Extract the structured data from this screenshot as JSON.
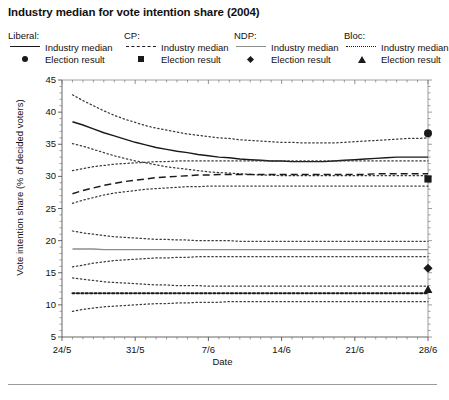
{
  "title": "Industry median for vote intention share (2004)",
  "legend": {
    "groups": [
      {
        "party": "Liberal:",
        "median_label": "Industry median",
        "result_label": "Election result",
        "style": "solid",
        "marker": "circle"
      },
      {
        "party": "CP:",
        "median_label": "Industry median",
        "result_label": "Election result",
        "style": "dashed",
        "marker": "square"
      },
      {
        "party": "NDP:",
        "median_label": "Industry median",
        "result_label": "Election result",
        "style": "solid-grey",
        "marker": "diamond"
      },
      {
        "party": "Bloc:",
        "median_label": "Industry median",
        "result_label": "Election result",
        "style": "dotted",
        "marker": "triangle"
      }
    ]
  },
  "chart_data": {
    "type": "line",
    "title": "Industry median for vote intention share (2004)",
    "xlabel": "Date",
    "ylabel": "Vote intention share (% of decided voters)",
    "xlim": [
      0,
      35
    ],
    "ylim": [
      5,
      45
    ],
    "yticks": [
      5,
      10,
      15,
      20,
      25,
      30,
      35,
      40,
      45
    ],
    "xtick_positions": [
      0,
      7,
      14,
      21,
      28
    ],
    "xticklabels": [
      "24/5",
      "31/5",
      "7/6",
      "14/6",
      "21/6",
      "28/6"
    ],
    "grid": false,
    "legend_position": "above-plot",
    "x": [
      1,
      2,
      3,
      4,
      5,
      6,
      7,
      8,
      9,
      10,
      11,
      12,
      13,
      14,
      15,
      16,
      17,
      18,
      19,
      20,
      21,
      22,
      23,
      24,
      25,
      26,
      27,
      28,
      29,
      30,
      31,
      32,
      33,
      34,
      35
    ],
    "series": [
      {
        "name": "Liberal industry median",
        "party": "Liberal",
        "style": "solid",
        "color": "#1a1a1a",
        "values": [
          38.5,
          38.0,
          37.4,
          36.8,
          36.3,
          35.8,
          35.3,
          34.9,
          34.5,
          34.2,
          33.9,
          33.7,
          33.4,
          33.2,
          33.0,
          32.9,
          32.7,
          32.6,
          32.5,
          32.4,
          32.4,
          32.3,
          32.3,
          32.3,
          32.3,
          32.4,
          32.5,
          32.6,
          32.7,
          32.8,
          32.9,
          33.0,
          33.0,
          33.0,
          33.0
        ]
      },
      {
        "name": "Liberal upper band",
        "party": "Liberal",
        "style": "dotted",
        "color": "#3a3a3a",
        "values": [
          42.7,
          41.8,
          41.0,
          40.2,
          39.5,
          38.9,
          38.4,
          37.9,
          37.5,
          37.2,
          36.9,
          36.6,
          36.4,
          36.2,
          36.0,
          35.9,
          35.7,
          35.6,
          35.5,
          35.4,
          35.3,
          35.3,
          35.2,
          35.2,
          35.2,
          35.2,
          35.3,
          35.4,
          35.5,
          35.6,
          35.7,
          35.8,
          35.9,
          35.9,
          36.0
        ]
      },
      {
        "name": "Liberal lower band",
        "party": "Liberal",
        "style": "dotted",
        "color": "#3a3a3a",
        "values": [
          35.1,
          34.7,
          34.2,
          33.7,
          33.2,
          32.8,
          32.4,
          32.1,
          31.8,
          31.5,
          31.3,
          31.1,
          30.9,
          30.7,
          30.6,
          30.5,
          30.4,
          30.3,
          30.2,
          30.2,
          30.1,
          30.1,
          30.1,
          30.1,
          30.1,
          30.1,
          30.1,
          30.1,
          30.1,
          30.1,
          30.1,
          30.1,
          30.1,
          30.1,
          30.1
        ]
      },
      {
        "name": "CP industry median",
        "party": "CP",
        "style": "dashed",
        "color": "#1a1a1a",
        "values": [
          27.3,
          27.8,
          28.2,
          28.6,
          28.9,
          29.2,
          29.4,
          29.6,
          29.8,
          29.9,
          30.0,
          30.1,
          30.2,
          30.2,
          30.3,
          30.3,
          30.3,
          30.3,
          30.3,
          30.3,
          30.3,
          30.3,
          30.3,
          30.3,
          30.3,
          30.3,
          30.3,
          30.3,
          30.3,
          30.4,
          30.4,
          30.4,
          30.4,
          30.4,
          30.4
        ]
      },
      {
        "name": "CP upper band",
        "party": "CP",
        "style": "dotted",
        "color": "#3a3a3a",
        "values": [
          30.9,
          31.2,
          31.5,
          31.7,
          31.9,
          32.0,
          32.1,
          32.2,
          32.3,
          32.3,
          32.4,
          32.4,
          32.4,
          32.4,
          32.4,
          32.4,
          32.4,
          32.4,
          32.4,
          32.4,
          32.4,
          32.4,
          32.4,
          32.4,
          32.4,
          32.4,
          32.4,
          32.4,
          32.4,
          32.4,
          32.4,
          32.4,
          32.4,
          32.4,
          32.4
        ]
      },
      {
        "name": "CP lower band",
        "party": "CP",
        "style": "dotted",
        "color": "#3a3a3a",
        "values": [
          25.8,
          26.3,
          26.7,
          27.1,
          27.4,
          27.6,
          27.8,
          28.0,
          28.1,
          28.2,
          28.3,
          28.4,
          28.4,
          28.5,
          28.5,
          28.5,
          28.5,
          28.5,
          28.5,
          28.5,
          28.5,
          28.5,
          28.5,
          28.5,
          28.5,
          28.5,
          28.5,
          28.5,
          28.5,
          28.5,
          28.5,
          28.5,
          28.5,
          28.5,
          28.5
        ]
      },
      {
        "name": "NDP industry median",
        "party": "NDP",
        "style": "solid-grey",
        "color": "#8d8d8d",
        "values": [
          18.7,
          18.7,
          18.7,
          18.6,
          18.6,
          18.6,
          18.6,
          18.6,
          18.6,
          18.6,
          18.6,
          18.6,
          18.6,
          18.6,
          18.6,
          18.6,
          18.6,
          18.6,
          18.6,
          18.6,
          18.6,
          18.6,
          18.6,
          18.6,
          18.6,
          18.6,
          18.6,
          18.6,
          18.6,
          18.6,
          18.6,
          18.6,
          18.6,
          18.6,
          18.6
        ]
      },
      {
        "name": "NDP upper band",
        "party": "NDP",
        "style": "dotted",
        "color": "#3a3a3a",
        "values": [
          21.5,
          21.2,
          21.0,
          20.8,
          20.6,
          20.5,
          20.4,
          20.3,
          20.2,
          20.2,
          20.1,
          20.1,
          20.0,
          20.0,
          20.0,
          20.0,
          19.9,
          19.9,
          19.9,
          19.9,
          19.9,
          19.9,
          19.9,
          19.9,
          19.9,
          19.9,
          19.9,
          19.9,
          19.9,
          19.9,
          19.9,
          19.9,
          19.9,
          19.9,
          19.9
        ]
      },
      {
        "name": "NDP lower band",
        "party": "NDP",
        "style": "dotted",
        "color": "#3a3a3a",
        "values": [
          15.9,
          16.2,
          16.5,
          16.7,
          16.9,
          17.0,
          17.1,
          17.2,
          17.3,
          17.3,
          17.4,
          17.4,
          17.5,
          17.5,
          17.5,
          17.5,
          17.5,
          17.5,
          17.5,
          17.5,
          17.5,
          17.5,
          17.5,
          17.5,
          17.5,
          17.5,
          17.5,
          17.5,
          17.5,
          17.5,
          17.5,
          17.5,
          17.5,
          17.5,
          17.5
        ]
      },
      {
        "name": "Bloc industry median",
        "party": "Bloc",
        "style": "dotted-thick",
        "color": "#1a1a1a",
        "values": [
          11.8,
          11.8,
          11.8,
          11.8,
          11.8,
          11.8,
          11.8,
          11.8,
          11.8,
          11.8,
          11.8,
          11.8,
          11.8,
          11.8,
          11.8,
          11.8,
          11.8,
          11.8,
          11.8,
          11.8,
          11.8,
          11.8,
          11.8,
          11.8,
          11.8,
          11.8,
          11.8,
          11.8,
          11.8,
          11.8,
          11.8,
          11.8,
          11.8,
          11.8,
          11.8
        ]
      },
      {
        "name": "Bloc upper band",
        "party": "Bloc",
        "style": "dotted",
        "color": "#3a3a3a",
        "values": [
          14.2,
          14.0,
          13.8,
          13.6,
          13.5,
          13.4,
          13.3,
          13.2,
          13.1,
          13.1,
          13.0,
          13.0,
          13.0,
          12.9,
          12.9,
          12.9,
          12.9,
          12.9,
          12.9,
          12.9,
          12.9,
          12.9,
          12.9,
          12.9,
          12.9,
          12.9,
          12.9,
          12.9,
          12.9,
          12.9,
          12.9,
          12.9,
          12.9,
          12.9,
          12.9
        ]
      },
      {
        "name": "Bloc lower band",
        "party": "Bloc",
        "style": "dotted",
        "color": "#3a3a3a",
        "values": [
          9.0,
          9.3,
          9.5,
          9.7,
          9.8,
          9.9,
          10.0,
          10.1,
          10.2,
          10.2,
          10.3,
          10.3,
          10.4,
          10.4,
          10.4,
          10.5,
          10.5,
          10.5,
          10.5,
          10.5,
          10.5,
          10.5,
          10.5,
          10.5,
          10.5,
          10.5,
          10.5,
          10.5,
          10.5,
          10.5,
          10.5,
          10.5,
          10.5,
          10.5,
          10.5
        ]
      }
    ],
    "election_results": [
      {
        "party": "Liberal",
        "marker": "circle",
        "x": 35,
        "value": 36.7
      },
      {
        "party": "CP",
        "marker": "square",
        "x": 35,
        "value": 29.6
      },
      {
        "party": "NDP",
        "marker": "diamond",
        "x": 35,
        "value": 15.7
      },
      {
        "party": "Bloc",
        "marker": "triangle",
        "x": 35,
        "value": 12.4
      }
    ]
  }
}
